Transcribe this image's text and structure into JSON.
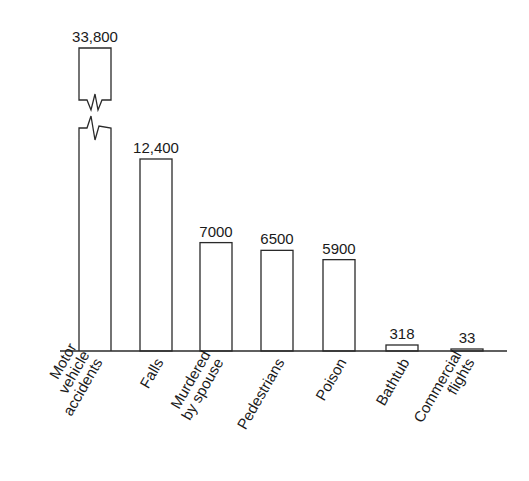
{
  "chart_data": {
    "type": "bar",
    "title": "",
    "xlabel": "",
    "ylabel": "",
    "grid": false,
    "legend": null,
    "axis_break": {
      "category": "Motor vehicle accidents",
      "note": "bar truncated with zigzag break"
    },
    "categories": [
      "Motor vehicle accidents",
      "Falls",
      "Murdered by spouse",
      "Pedestrians",
      "Poison",
      "Bathtub",
      "Commercial flights"
    ],
    "category_lines": [
      [
        "Motor",
        "vehicle",
        "accidents"
      ],
      [
        "Falls"
      ],
      [
        "Murdered",
        "by spouse"
      ],
      [
        "Pedestrians"
      ],
      [
        "Poison"
      ],
      [
        "Bathtub"
      ],
      [
        "Commercial",
        "flights"
      ]
    ],
    "values": [
      33800,
      12400,
      7000,
      6500,
      5900,
      318,
      33
    ],
    "value_labels": [
      "33,800",
      "12,400",
      "7000",
      "6500",
      "5900",
      "318",
      "33"
    ],
    "bar_color": "#ffffff",
    "edge_color": "#2a2a2a"
  }
}
